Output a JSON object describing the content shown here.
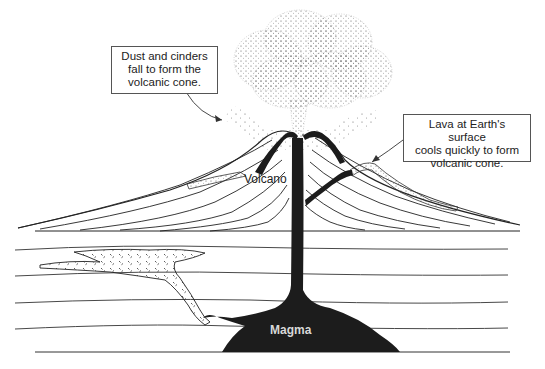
{
  "diagram": {
    "title": "",
    "labels": {
      "volcano": "Volcano",
      "magma": "Magma"
    },
    "callouts": [
      {
        "id": "dust",
        "lines": [
          "Dust and cinders",
          "fall to form the",
          "volcanic cone."
        ]
      },
      {
        "id": "lava",
        "lines": [
          "Lava at Earth's surface",
          "cools quickly to form",
          "volcanic cone."
        ]
      }
    ],
    "colors": {
      "ink": "#1a1a1a",
      "magma": "#1c1c1c",
      "background": "#ffffff"
    }
  }
}
